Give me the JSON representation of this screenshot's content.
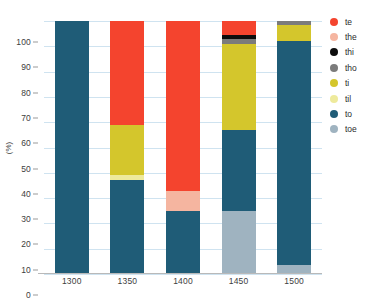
{
  "chart_data": {
    "type": "bar",
    "stacked": true,
    "title": "",
    "xlabel": "",
    "ylabel": "(%)",
    "categories": [
      "1300",
      "1350",
      "1400",
      "1450",
      "1500"
    ],
    "ylim": [
      0,
      100
    ],
    "yticks": [
      0,
      10,
      20,
      30,
      40,
      50,
      60,
      70,
      80,
      90,
      100
    ],
    "grid": true,
    "legend_position": "right",
    "series": [
      {
        "name": "te",
        "color": "#f4442e",
        "values": [
          0,
          41.0,
          67.0,
          5.5,
          0
        ]
      },
      {
        "name": "the",
        "color": "#f5b5a0",
        "values": [
          0,
          0,
          8.0,
          0,
          0
        ]
      },
      {
        "name": "thi",
        "color": "#0d0d0d",
        "values": [
          0,
          0,
          0,
          1.5,
          0
        ]
      },
      {
        "name": "tho",
        "color": "#7b7b7b",
        "values": [
          0,
          0,
          0,
          2.0,
          1.5
        ]
      },
      {
        "name": "ti",
        "color": "#d4c62c",
        "values": [
          0,
          20.0,
          0,
          34.0,
          6.5
        ]
      },
      {
        "name": "til",
        "color": "#eeea9c",
        "values": [
          0,
          2.0,
          0,
          0,
          0
        ]
      },
      {
        "name": "to",
        "color": "#1f5c77",
        "values": [
          100.0,
          37.0,
          25.0,
          32.0,
          88.5
        ]
      },
      {
        "name": "toe",
        "color": "#9fb3c0",
        "values": [
          0,
          0,
          0,
          25.0,
          3.5
        ]
      }
    ]
  },
  "legend": {
    "items": [
      {
        "label": "te",
        "color": "#f4442e"
      },
      {
        "label": "the",
        "color": "#f5b5a0"
      },
      {
        "label": "thi",
        "color": "#0d0d0d"
      },
      {
        "label": "tho",
        "color": "#7b7b7b"
      },
      {
        "label": "ti",
        "color": "#d4c62c"
      },
      {
        "label": "til",
        "color": "#eeea9c"
      },
      {
        "label": "to",
        "color": "#1f5c77"
      },
      {
        "label": "toe",
        "color": "#9fb3c0"
      }
    ]
  },
  "axes": {
    "y_title": "(%)",
    "y_ticks": [
      "100",
      "90",
      "80",
      "70",
      "60",
      "50",
      "40",
      "30",
      "20",
      "10",
      "0"
    ],
    "x_ticks": [
      "1300",
      "1350",
      "1400",
      "1450",
      "1500"
    ]
  },
  "colors": {
    "gridline": "#cfe3f0",
    "axis": "#b9b9b9",
    "text": "#3d3d3d",
    "background": "#ffffff"
  }
}
